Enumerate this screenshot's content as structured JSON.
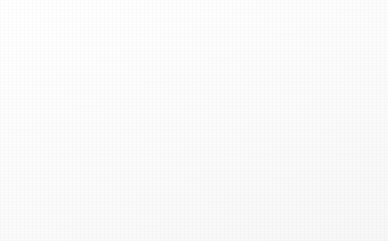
{
  "chart_data": {
    "type": "pie",
    "title": "",
    "subtitle": "",
    "xlabel": "",
    "ylabel": "",
    "grid": false,
    "legend_position": "right",
    "start_angle_deg": 0,
    "direction": "clockwise",
    "categories": [
      "Partial acceptance",
      "Full acceptance",
      "Self-acceptance",
      "Beyond acceptance (role models)"
    ],
    "values": [
      25,
      41,
      17,
      17
    ],
    "value_labels": [
      "25%",
      "41%",
      "17%",
      "17%"
    ],
    "colors": [
      "#e9e9e9",
      "#cdcdcd",
      "#b1b1b1",
      "#999999"
    ],
    "slices": [
      {
        "label": "Partial acceptance",
        "value": 25,
        "value_label": "25%",
        "color": "#e9e9e9"
      },
      {
        "label": "Full acceptance",
        "value": 41,
        "value_label": "41%",
        "color": "#cdcdcd"
      },
      {
        "label": "Self-acceptance",
        "value": 17,
        "value_label": "17%",
        "color": "#b1b1b1"
      },
      {
        "label": "Beyond acceptance (role models)",
        "value": 17,
        "value_label": "17%",
        "color": "#999999"
      }
    ]
  },
  "legend": {
    "items": [
      {
        "label": "Partial acceptance",
        "color": "#e9e9e9"
      },
      {
        "label": "Full acceptance",
        "color": "#cdcdcd"
      },
      {
        "label": "Self-acceptance",
        "color": "#b1b1b1"
      },
      {
        "label": "Beyond acceptance\n(role models)",
        "color": "#999999"
      }
    ]
  }
}
